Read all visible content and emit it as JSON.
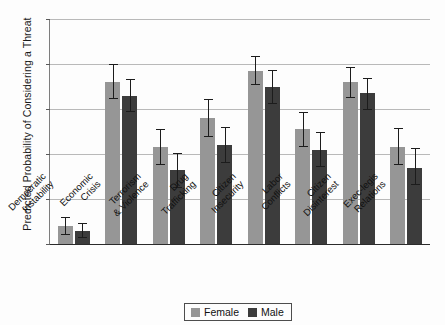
{
  "chart_data": {
    "type": "bar",
    "title": "",
    "xlabel": "",
    "ylabel": "Predicted Probability of Considering a Threat",
    "ylim": [
      0,
      1
    ],
    "yticks": [
      "0",
      "0.20",
      "0.40",
      "0.60",
      "0.80",
      "1"
    ],
    "ytick_values": [
      0,
      0.2,
      0.4,
      0.6,
      0.8,
      1
    ],
    "grid": true,
    "legend_position": "bottom-center",
    "categories": [
      "Democratic Instability",
      "Economic Crisis",
      "Terrorism & Violence",
      "Drug Trafficking",
      "Citizen Insecurity",
      "Labor Conflicts",
      "Citizen Disinterest",
      "Exec-legis Relations"
    ],
    "category_lines": [
      [
        "Democratic",
        "Instability"
      ],
      [
        "Economic",
        "Crisis"
      ],
      [
        "Terrorism",
        "& Violence"
      ],
      [
        "Drug",
        "Trafficking"
      ],
      [
        "Citizen",
        "Insecurity"
      ],
      [
        "Labor",
        "Conflicts"
      ],
      [
        "Citizen",
        "Disinterest"
      ],
      [
        "Exec-legis",
        "Relations"
      ]
    ],
    "series": [
      {
        "name": "Female",
        "color": "#969696",
        "values": [
          0.08,
          0.72,
          0.43,
          0.56,
          0.77,
          0.51,
          0.72,
          0.43
        ],
        "ci_low": [
          0.045,
          0.65,
          0.355,
          0.48,
          0.71,
          0.435,
          0.655,
          0.355
        ],
        "ci_high": [
          0.12,
          0.8,
          0.51,
          0.645,
          0.835,
          0.585,
          0.785,
          0.515
        ]
      },
      {
        "name": "Male",
        "color": "#3c3c3c",
        "values": [
          0.06,
          0.66,
          0.33,
          0.44,
          0.7,
          0.42,
          0.67,
          0.34
        ],
        "ci_low": [
          0.032,
          0.59,
          0.255,
          0.365,
          0.625,
          0.345,
          0.6,
          0.265
        ],
        "ci_high": [
          0.095,
          0.735,
          0.405,
          0.52,
          0.775,
          0.5,
          0.74,
          0.425
        ]
      }
    ]
  },
  "legend": {
    "items": [
      {
        "label": "Female",
        "color": "#969696"
      },
      {
        "label": "Male",
        "color": "#3c3c3c"
      }
    ]
  }
}
